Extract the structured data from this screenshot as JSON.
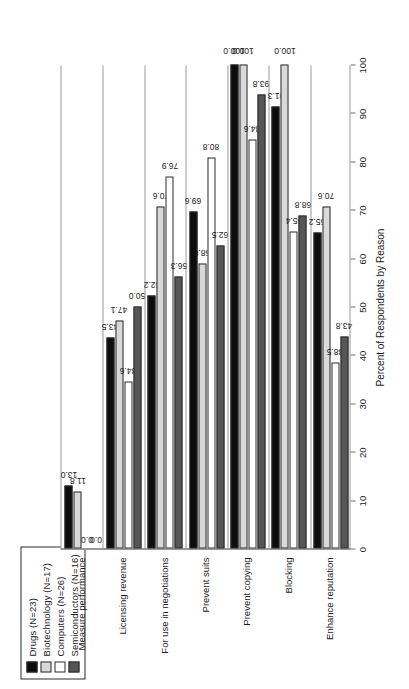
{
  "chart_data": {
    "type": "bar",
    "orientation": "vertical-rotated",
    "title": "",
    "xlabel": "",
    "ylabel": "Percent of Respondents by Reason",
    "ylim": [
      0,
      100
    ],
    "ytick_step": 10,
    "grid": false,
    "legend_position": "top-left",
    "categories": [
      "Measure performance",
      "Licensing revenue",
      "For use in negotiations",
      "Prevent suits",
      "Prevent copying",
      "Blocking",
      "Enhance reputation"
    ],
    "ticks": [
      0,
      10,
      20,
      30,
      40,
      50,
      60,
      70,
      80,
      90,
      100
    ],
    "series": [
      {
        "name": "Drugs (N=23)",
        "color": "#0d0d0d",
        "values": [
          13.0,
          43.5,
          52.2,
          69.6,
          100.0,
          91.3,
          65.2
        ],
        "labels": [
          "13.0",
          "43.5",
          "52.2",
          "69.6",
          "100.0",
          "91.3",
          "65.2"
        ]
      },
      {
        "name": "Biotechnology (N=17)",
        "color": "#d9d9d9",
        "values": [
          11.8,
          47.1,
          70.6,
          58.8,
          100.0,
          100.0,
          70.6
        ],
        "labels": [
          "11.8",
          "47.1",
          "70.6",
          "58.8",
          "100.0",
          "100.0",
          "70.6"
        ]
      },
      {
        "name": "Computers (N=26)",
        "color": "#ffffff",
        "values": [
          0.0,
          34.6,
          76.9,
          80.8,
          84.6,
          65.4,
          38.5
        ],
        "labels": [
          "0.0",
          "34.6",
          "76.9",
          "80.8",
          "84.6",
          "65.4",
          "38.5"
        ]
      },
      {
        "name": "Semiconductors (N=16)",
        "color": "#565656",
        "values": [
          0.0,
          50.0,
          56.3,
          62.5,
          93.8,
          68.8,
          43.8
        ],
        "labels": [
          "0.0",
          "50.0",
          "56.3",
          "62.5",
          "93.8",
          "68.8",
          "43.8"
        ]
      }
    ]
  },
  "legend": {
    "items": [
      {
        "label": "Drugs (N=23)",
        "swatch": "legend-swatch-drugs"
      },
      {
        "label": "Biotechnology (N=17)",
        "swatch": "legend-swatch-biotechnology"
      },
      {
        "label": "Computers (N=26)",
        "swatch": "legend-swatch-computers"
      },
      {
        "label": "Semiconductors (N=16)",
        "swatch": "legend-swatch-semiconductors"
      }
    ]
  }
}
